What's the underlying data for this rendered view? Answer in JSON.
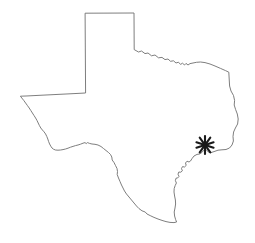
{
  "map": {
    "title": "Texas",
    "region_name": "Texas",
    "background_color": "#ffffff",
    "outline_color": "#6f6f6f",
    "outline_width": 0.9,
    "fill_color": "#ffffff",
    "width": 255,
    "height": 243,
    "markers": [
      {
        "name": "location-marker",
        "glyph": "asterisk",
        "symbol": "*",
        "color": "#1a1a1a",
        "x": 205,
        "y": 145,
        "size": 9,
        "label": ""
      }
    ],
    "outline_path": "M 85.5 13.2 L 134.0 13.0 L 134.2 49.6 L 138.5 52.0 L 141.5 51.0 L 145.0 53.6 L 148.0 53.0 L 151.5 55.8 L 155.0 55.0 L 158.5 57.8 L 162.0 57.4 L 165.0 59.6 L 168.0 59.0 L 170.5 61.3 L 173.5 60.8 L 176.0 63.0 L 178.5 62.2 L 180.5 64.4 L 182.5 63.2 L 184.5 65.0 L 186.0 63.4 L 188.0 65.0 L 190.0 63.6 L 193.0 63.0 L 196.5 62.3 L 200.5 62.0 L 205.0 62.6 L 210.0 64.0 L 215.0 66.0 L 220.5 68.4 L 225.5 70.6 L 228.8 72.2 L 229.2 79.0 L 229.6 86.0 L 231.0 91.0 L 233.5 95.5 L 234.6 100.5 L 234.2 105.0 L 235.6 109.5 L 237.3 114.0 L 238.2 119.0 L 237.6 124.0 L 235.4 128.0 L 233.6 132.0 L 233.0 136.5 L 233.4 141.0 L 232.0 145.0 L 229.5 148.0 L 226.0 149.5 L 222.0 149.8 L 218.0 150.2 L 214.0 151.6 L 211.0 152.6 L 208.5 152.0 L 206.5 150.2 L 205.0 149.0 L 203.5 150.4 L 202.0 152.4 L 199.5 154.0 L 197.0 154.4 L 194.0 156.0 L 192.0 158.6 L 190.5 161.0 L 189.0 162.0 L 187.0 161.2 L 185.5 163.0 L 186.2 165.4 L 184.5 167.0 L 182.5 166.6 L 181.5 168.6 L 182.4 170.8 L 180.8 172.2 L 178.8 172.0 L 178.0 174.2 L 179.0 176.4 L 177.6 178.0 L 176.0 178.2 L 175.4 180.6 L 176.4 183.0 L 175.2 185.5 L 174.2 188.5 L 174.0 192.0 L 174.6 196.0 L 175.4 200.0 L 175.6 204.0 L 175.0 208.0 L 174.2 212.0 L 174.6 216.0 L 175.6 219.5 L 176.6 222.0 L 174.0 222.6 L 170.0 222.4 L 166.0 221.6 L 162.0 220.4 L 158.0 219.0 L 154.0 217.4 L 150.2 215.6 L 147.0 214.0 L 145.2 212.0 L 142.0 210.8 L 139.0 208.6 L 136.5 206.0 L 134.0 203.0 L 131.5 200.0 L 129.0 197.0 L 126.5 194.0 L 124.5 191.0 L 123.0 188.0 L 121.5 185.0 L 120.0 181.5 L 118.5 178.0 L 117.2 174.5 L 117.5 171.5 L 117.0 168.5 L 115.5 165.5 L 114.0 162.5 L 112.2 160.0 L 111.8 157.0 L 110.5 154.5 L 108.5 152.5 L 106.0 150.5 L 103.5 148.5 L 101.0 146.5 L 98.0 145.0 L 95.0 144.3 L 92.0 144.0 L 89.5 143.4 L 87.5 142.6 L 86.2 143.6 L 85.0 142.6 L 83.0 143.2 L 80.5 144.2 L 78.0 145.0 L 75.5 145.6 L 73.0 146.4 L 70.5 147.2 L 68.0 148.2 L 65.5 149.0 L 63.0 149.6 L 60.5 150.0 L 58.0 150.2 L 55.5 150.0 L 53.5 149.2 L 52.0 148.0 L 50.8 146.2 L 49.6 144.0 L 48.6 141.5 L 47.8 139.0 L 46.8 136.5 L 45.6 134.0 L 44.0 131.8 L 42.4 130.0 L 40.8 128.0 L 39.4 125.5 L 38.2 123.0 L 37.0 120.5 L 35.6 118.0 L 34.0 115.5 L 32.4 113.0 L 30.8 110.5 L 29.2 108.0 L 27.4 105.5 L 25.6 103.0 L 23.8 100.5 L 21.8 98.0 L 20.4 96.2 L 26.0 96.0 L 34.0 95.6 L 42.0 95.2 L 50.0 94.8 L 58.0 94.4 L 66.0 94.0 L 74.0 93.6 L 82.0 93.2 L 85.2 93.0 Z"
  }
}
